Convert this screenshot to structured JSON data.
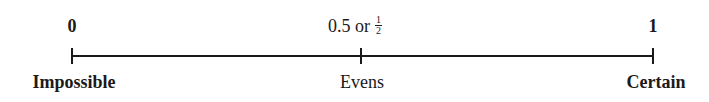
{
  "diagram": {
    "type": "probability-scale",
    "points": [
      {
        "value_label": "0",
        "description": "Impossible",
        "bold": true
      },
      {
        "value_label": "0.5 or",
        "fraction": {
          "numerator": "1",
          "denominator": "2"
        },
        "description": "Evens",
        "bold": false
      },
      {
        "value_label": "1",
        "description": "Certain",
        "bold": true
      }
    ]
  }
}
